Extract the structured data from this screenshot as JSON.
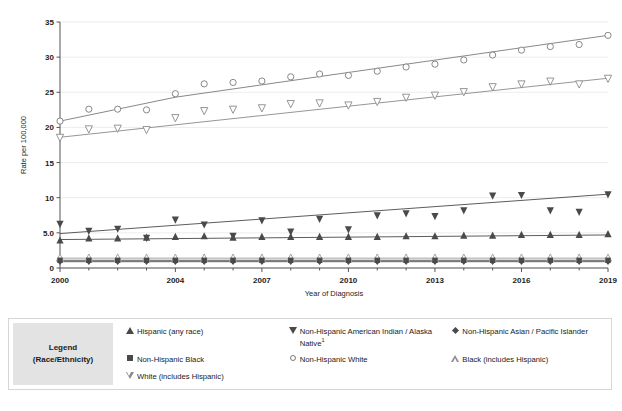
{
  "chart_data": {
    "type": "line",
    "title": "",
    "xlabel": "Year of Diagnosis",
    "ylabel": "Rate per 100,000",
    "xlim": [
      2000,
      2019
    ],
    "ylim": [
      0,
      35
    ],
    "grid": true,
    "legend_position": "bottom",
    "x": [
      2000,
      2001,
      2002,
      2003,
      2004,
      2005,
      2006,
      2007,
      2008,
      2009,
      2010,
      2011,
      2012,
      2013,
      2014,
      2015,
      2016,
      2017,
      2018,
      2019
    ],
    "xticks": [
      2000,
      2004,
      2007,
      2010,
      2013,
      2016,
      2019
    ],
    "xticklabels": [
      "2000",
      "2004",
      "2007",
      "2010",
      "2013",
      "2016",
      "2019"
    ],
    "yticks": [
      0,
      5,
      10,
      15,
      20,
      25,
      30,
      35
    ],
    "yticklabels": [
      "0",
      "5.0",
      "10",
      "15",
      "20",
      "25",
      "30",
      "35"
    ],
    "series": [
      {
        "name": "Non-Hispanic White",
        "marker": "circle-open",
        "color": "#7a7a7a",
        "values": [
          20.9,
          22.6,
          22.6,
          22.5,
          24.8,
          26.2,
          26.4,
          26.6,
          27.2,
          27.6,
          27.4,
          28.0,
          28.6,
          29.0,
          29.6,
          30.3,
          31.0,
          31.5,
          31.8,
          33.1
        ]
      },
      {
        "name": "White (includes Hispanic)",
        "marker": "triangle-down-open",
        "color": "#8a8a8a",
        "values": [
          18.6,
          19.8,
          19.9,
          19.7,
          21.4,
          22.4,
          22.6,
          22.8,
          23.4,
          23.5,
          23.2,
          23.7,
          24.3,
          24.6,
          25.1,
          25.8,
          26.2,
          26.6,
          26.2,
          27.0
        ]
      },
      {
        "name": "Non-Hispanic American Indian / Alaska Native",
        "marker": "triangle-down-filled",
        "color": "#4a4a4a",
        "values": [
          6.3,
          5.3,
          5.6,
          4.3,
          6.9,
          6.2,
          4.6,
          6.8,
          5.2,
          7.0,
          5.5,
          7.5,
          7.8,
          7.4,
          8.2,
          10.3,
          10.4,
          8.2,
          8.0,
          10.5
        ]
      },
      {
        "name": "Hispanic (any race)",
        "marker": "triangle-up-filled",
        "color": "#4a4a4a",
        "values": [
          3.9,
          4.2,
          4.2,
          4.3,
          4.4,
          4.5,
          4.3,
          4.4,
          4.4,
          4.4,
          4.4,
          4.4,
          4.5,
          4.5,
          4.6,
          4.6,
          4.7,
          4.7,
          4.7,
          4.8
        ]
      },
      {
        "name": "Black (includes Hispanic)",
        "marker": "triangle-up-open",
        "color": "#9a9a9a",
        "values": [
          1.4,
          1.4,
          1.4,
          1.4,
          1.4,
          1.4,
          1.4,
          1.4,
          1.4,
          1.4,
          1.4,
          1.4,
          1.4,
          1.4,
          1.4,
          1.4,
          1.4,
          1.4,
          1.4,
          1.4
        ]
      },
      {
        "name": "Non-Hispanic Black",
        "marker": "square",
        "color": "#4a4a4a",
        "values": [
          1.1,
          1.1,
          1.1,
          1.1,
          1.1,
          1.1,
          1.1,
          1.1,
          1.1,
          1.1,
          1.1,
          1.1,
          1.1,
          1.1,
          1.1,
          1.1,
          1.1,
          1.1,
          1.1,
          1.1
        ]
      },
      {
        "name": "Non-Hispanic Asian / Pacific Islander",
        "marker": "diamond",
        "color": "#4a4a4a",
        "values": [
          0.9,
          0.9,
          0.9,
          0.9,
          0.9,
          0.9,
          0.9,
          0.9,
          0.9,
          0.9,
          0.9,
          0.9,
          0.9,
          0.9,
          0.9,
          0.9,
          0.9,
          0.9,
          0.9,
          0.9
        ]
      }
    ],
    "trendlines": [
      {
        "name": "Non-Hispanic White",
        "points": [
          [
            2000,
            20.9
          ],
          [
            2004,
            24.3
          ],
          [
            2019,
            33.1
          ]
        ]
      },
      {
        "name": "White (includes Hispanic)",
        "points": [
          [
            2000,
            18.6
          ],
          [
            2019,
            27.0
          ]
        ]
      },
      {
        "name": "Non-Hispanic American Indian / Alaska Native",
        "points": [
          [
            2000,
            4.9
          ],
          [
            2019,
            10.5
          ]
        ]
      },
      {
        "name": "Hispanic (any race)",
        "points": [
          [
            2000,
            4.05
          ],
          [
            2019,
            4.7
          ]
        ]
      },
      {
        "name": "Black (includes Hispanic)",
        "points": [
          [
            2000,
            1.4
          ],
          [
            2019,
            1.4
          ]
        ]
      },
      {
        "name": "Non-Hispanic Black",
        "points": [
          [
            2000,
            1.1
          ],
          [
            2019,
            1.1
          ]
        ]
      },
      {
        "name": "Non-Hispanic Asian / Pacific Islander",
        "points": [
          [
            2000,
            0.9
          ],
          [
            2019,
            0.9
          ]
        ]
      }
    ]
  },
  "legend": {
    "title_line1": "Legend",
    "title_line2": "(Race/Ethnicity)",
    "entries": [
      {
        "marker": "triangle-up-filled",
        "label": "Hispanic (any race)",
        "footnote": ""
      },
      {
        "marker": "triangle-down-filled",
        "label": "Non-Hispanic American Indian / Alaska Native",
        "footnote": "1"
      },
      {
        "marker": "diamond",
        "label": "Non-Hispanic Asian / Pacific Islander",
        "footnote": ""
      },
      {
        "marker": "square",
        "label": "Non-Hispanic Black",
        "footnote": ""
      },
      {
        "marker": "circle-open",
        "label": "Non-Hispanic White",
        "footnote": ""
      },
      {
        "marker": "triangle-up-open",
        "label": "Black (includes Hispanic)",
        "footnote": ""
      },
      {
        "marker": "triangle-down-open",
        "label": "White (includes Hispanic)",
        "footnote": ""
      }
    ]
  }
}
